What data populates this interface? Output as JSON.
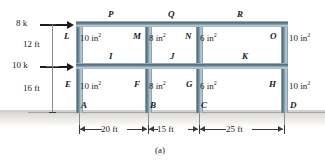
{
  "figure": {
    "caption": "(a)",
    "type": "structural-frame-diagram"
  },
  "loads": [
    {
      "id": "load-top",
      "label": "8 k"
    },
    {
      "id": "load-middle",
      "label": "10 k"
    }
  ],
  "story_heights": [
    {
      "id": "story-upper",
      "label": "12 ft"
    },
    {
      "id": "story-lower",
      "label": "16 ft"
    }
  ],
  "bay_widths": [
    {
      "id": "bay-1",
      "label": "20 ft"
    },
    {
      "id": "bay-2",
      "label": "15 ft"
    },
    {
      "id": "bay-3",
      "label": "25 ft"
    }
  ],
  "nodes": {
    "base": [
      "A",
      "B",
      "C",
      "D"
    ],
    "lower": [
      "E",
      "F",
      "G",
      "H"
    ],
    "midbeam": [
      "I",
      "J",
      "K"
    ],
    "upper": [
      "L",
      "M",
      "N",
      "O"
    ],
    "topbeam": [
      "P",
      "Q",
      "R"
    ]
  },
  "areas": {
    "upper_story": [
      {
        "member": "L-column",
        "value": "10 in",
        "exp": "2"
      },
      {
        "member": "M-column",
        "value": "8 in",
        "exp": "2"
      },
      {
        "member": "N-column",
        "value": "6 in",
        "exp": "2"
      },
      {
        "member": "O-column",
        "value": "10 in",
        "exp": "2"
      }
    ],
    "lower_story": [
      {
        "member": "E-column",
        "value": "10 in",
        "exp": "2"
      },
      {
        "member": "F-column",
        "value": "8 in",
        "exp": "2"
      },
      {
        "member": "G-column",
        "value": "6 in",
        "exp": "2"
      },
      {
        "member": "H-column",
        "value": "10 in",
        "exp": "2"
      }
    ]
  },
  "colors": {
    "member": "#51707f",
    "member_highlight": "#c3d2da",
    "ground": "#cfcdc9",
    "text": "#1b1b1b"
  }
}
